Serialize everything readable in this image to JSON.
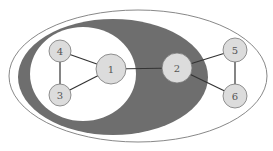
{
  "diagram": {
    "type": "graph-with-nested-regions",
    "colors": {
      "background": "#ffffff",
      "outer_region_stroke": "#888888",
      "middle_region_fill": "#6e6e6e",
      "inner_region_fill": "#ffffff",
      "node_fill": "#dcdcdc",
      "node_stroke": "#777777",
      "edge": "#333333"
    },
    "regions": [
      {
        "id": "outer",
        "cx": 138,
        "cy": 76,
        "rx": 129,
        "ry": 66
      },
      {
        "id": "middle",
        "cx": 113,
        "cy": 77,
        "rx": 95,
        "ry": 58
      },
      {
        "id": "inner",
        "cx": 83,
        "cy": 74,
        "rx": 53,
        "ry": 47
      }
    ],
    "nodes": [
      {
        "id": "1",
        "label": "1",
        "cx": 111,
        "cy": 69,
        "r": 15
      },
      {
        "id": "2",
        "label": "2",
        "cx": 177,
        "cy": 68,
        "r": 15
      },
      {
        "id": "3",
        "label": "3",
        "cx": 60,
        "cy": 95,
        "r": 11
      },
      {
        "id": "4",
        "label": "4",
        "cx": 60,
        "cy": 51,
        "r": 11
      },
      {
        "id": "5",
        "label": "5",
        "cx": 235,
        "cy": 50,
        "r": 12
      },
      {
        "id": "6",
        "label": "6",
        "cx": 235,
        "cy": 96,
        "r": 12
      }
    ],
    "edges": [
      {
        "from": "4",
        "to": "1"
      },
      {
        "from": "3",
        "to": "1"
      },
      {
        "from": "4",
        "to": "3"
      },
      {
        "from": "1",
        "to": "2"
      },
      {
        "from": "2",
        "to": "5"
      },
      {
        "from": "2",
        "to": "6"
      },
      {
        "from": "5",
        "to": "6"
      }
    ]
  }
}
